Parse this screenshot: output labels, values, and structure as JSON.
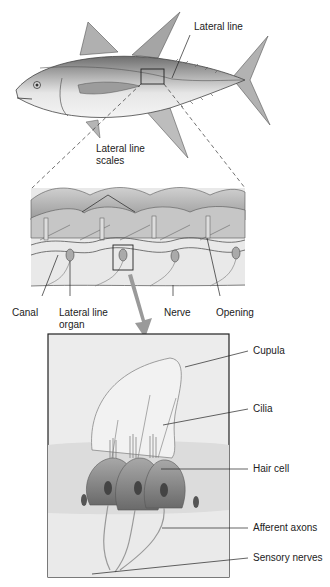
{
  "diagram": {
    "top": {
      "lateral_line_label": "Lateral line"
    },
    "middle": {
      "scales_label_line1": "Lateral line",
      "scales_label_line2": "scales",
      "canal_label": "Canal",
      "organ_label_line1": "Lateral line",
      "organ_label_line2": "organ",
      "nerve_label": "Nerve",
      "opening_label": "Opening"
    },
    "bottom": {
      "cupula_label": "Cupula",
      "cilia_label": "Cilia",
      "hair_cell_label": "Hair cell",
      "afferent_axons_label": "Afferent axons",
      "sensory_nerves_label": "Sensory nerves"
    }
  }
}
